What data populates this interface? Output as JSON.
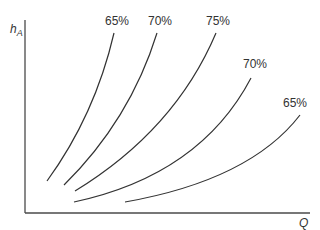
{
  "diagram": {
    "y_axis_label": "h",
    "y_axis_label_subscript": "A",
    "x_axis_label": "Q",
    "curves": [
      {
        "label": "65%",
        "start": [
          47,
          181
        ],
        "ctrl": [
          95,
          115
        ],
        "end": [
          114,
          33
        ],
        "label_pos": [
          105,
          25
        ]
      },
      {
        "label": "70%",
        "start": [
          64,
          185
        ],
        "ctrl": [
          130,
          120
        ],
        "end": [
          157,
          33
        ],
        "label_pos": [
          148,
          25
        ]
      },
      {
        "label": "75%",
        "start": [
          75,
          191
        ],
        "ctrl": [
          175,
          130
        ],
        "end": [
          216,
          33
        ],
        "label_pos": [
          206,
          25
        ]
      },
      {
        "label": "70%",
        "start": [
          74,
          202
        ],
        "ctrl": [
          200,
          175
        ],
        "end": [
          251,
          78
        ],
        "label_pos": [
          243,
          68
        ]
      },
      {
        "label": "65%",
        "start": [
          125,
          202
        ],
        "ctrl": [
          250,
          180
        ],
        "end": [
          300,
          115
        ],
        "label_pos": [
          283,
          107
        ]
      }
    ]
  }
}
